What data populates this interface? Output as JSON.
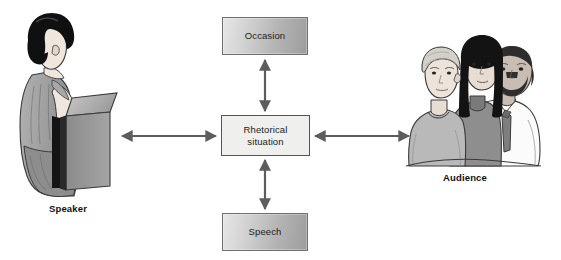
{
  "diagram": {
    "nodes": {
      "occasion": {
        "label": "Occasion"
      },
      "center": {
        "label_line1": "Rhetorical",
        "label_line2": "situation"
      },
      "speech": {
        "label": "Speech"
      }
    },
    "figures": {
      "speaker": {
        "label": "Speaker"
      },
      "audience": {
        "label": "Audience"
      }
    },
    "connectors": [
      {
        "name": "occasion-to-center",
        "orientation": "vertical",
        "double_headed": true
      },
      {
        "name": "speech-to-center",
        "orientation": "vertical",
        "double_headed": true
      },
      {
        "name": "speaker-to-center",
        "orientation": "horizontal",
        "double_headed": true
      },
      {
        "name": "center-to-audience",
        "orientation": "horizontal",
        "double_headed": true
      }
    ],
    "colors": {
      "background": "#ffffff",
      "box_stroke": "#6f6f6f",
      "center_fill": "#efefed",
      "gradient_light": "#e6e6e6",
      "gradient_dark": "#9d9d9d",
      "arrow": "#5d5d5d",
      "text": "#1b1b1b",
      "hair_dark": "#111111",
      "skin": "#ece2da",
      "garment_gray": "#9b9b9b",
      "podium": "#8f8f8f"
    }
  }
}
